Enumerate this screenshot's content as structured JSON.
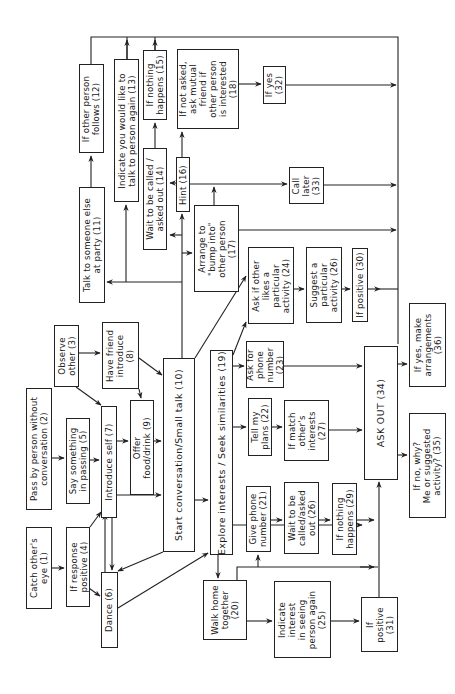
{
  "diagram": {
    "type": "flowchart",
    "orientation": "rotated-90-ccw",
    "nodes": [
      {
        "id": 1,
        "label": "Catch other's\neye (1)",
        "x": 26,
        "y": 527,
        "w": 26,
        "h": 82
      },
      {
        "id": 2,
        "label": "Pass by person without\nconversation (2)",
        "x": 26,
        "y": 388,
        "w": 26,
        "h": 122
      },
      {
        "id": 3,
        "label": "Observe\nother (3)",
        "x": 54,
        "y": 325,
        "w": 25,
        "h": 62
      },
      {
        "id": 4,
        "label": "If response\npositive (4)",
        "x": 66,
        "y": 527,
        "w": 24,
        "h": 80
      },
      {
        "id": 5,
        "label": "Say something\nin passing (5)",
        "x": 66,
        "y": 418,
        "w": 24,
        "h": 86
      },
      {
        "id": 6,
        "label": "Dance (6)",
        "x": 101,
        "y": 572,
        "w": 17,
        "h": 76
      },
      {
        "id": 7,
        "label": "Introduce self (7)",
        "x": 101,
        "y": 406,
        "w": 16,
        "h": 112
      },
      {
        "id": 8,
        "label": "Have friend\nintroduce\n(8)",
        "x": 102,
        "y": 322,
        "w": 37,
        "h": 67
      },
      {
        "id": 9,
        "label": "Offer\nfood/drink (9)",
        "x": 130,
        "y": 400,
        "w": 24,
        "h": 95
      },
      {
        "id": 10,
        "label": "Start conversation/Small talk (10)",
        "x": 163,
        "y": 358,
        "w": 32,
        "h": 194
      },
      {
        "id": 11,
        "label": "Talk to someone else\nat party (11)",
        "x": 79,
        "y": 187,
        "w": 26,
        "h": 116
      },
      {
        "id": 12,
        "label": "If other person\nfollows (12)",
        "x": 79,
        "y": 64,
        "w": 25,
        "h": 89
      },
      {
        "id": 13,
        "label": "Indicate you would like to\ntalk to person again (13)",
        "x": 114,
        "y": 59,
        "w": 25,
        "h": 143
      },
      {
        "id": 14,
        "label": "Wait to be called /\nasked out (14)",
        "x": 143,
        "y": 148,
        "w": 24,
        "h": 102
      },
      {
        "id": 15,
        "label": "If nothing\nhappens (15)",
        "x": 143,
        "y": 50,
        "w": 24,
        "h": 70
      },
      {
        "id": 16,
        "label": "Hint (16)",
        "x": 176,
        "y": 157,
        "w": 14,
        "h": 55
      },
      {
        "id": 17,
        "label": "Arrange to\n\"bump into\"\nother person\n(17)",
        "x": 194,
        "y": 205,
        "w": 45,
        "h": 87
      },
      {
        "id": 18,
        "label": "If not asked,\nask mutual\nfriend if\nother person\nis interested\n(18)",
        "x": 177,
        "y": 49,
        "w": 62,
        "h": 80
      },
      {
        "id": 19,
        "label": "Explore interests / Seek similarities (19)",
        "x": 210,
        "y": 350,
        "w": 23,
        "h": 205
      },
      {
        "id": 20,
        "label": "Walk home\ntogether\n(20)",
        "x": 203,
        "y": 580,
        "w": 44,
        "h": 60
      },
      {
        "id": 21,
        "label": "Give phone\nnumber (21)",
        "x": 246,
        "y": 486,
        "w": 25,
        "h": 66
      },
      {
        "id": 22,
        "label": "Tell my\nplans (22)",
        "x": 248,
        "y": 398,
        "w": 24,
        "h": 58
      },
      {
        "id": 23,
        "label": "Ask for\nphone\nnumber\n(23)",
        "x": 246,
        "y": 341,
        "w": 38,
        "h": 47
      },
      {
        "id": 24,
        "label": "Ask if other\nlikes a\nparticular\nactivity (24)",
        "x": 248,
        "y": 247,
        "w": 46,
        "h": 77
      },
      {
        "id": 25,
        "label": "Indicate\ninterest\nin seeing\nperson again\n(25)",
        "x": 274,
        "y": 581,
        "w": 57,
        "h": 77
      },
      {
        "id": 26,
        "label": "Suggest a\nparticular\nactivity (26)",
        "x": 306,
        "y": 247,
        "w": 36,
        "h": 76
      },
      {
        "id": "26b",
        "label": "Wait to be\ncalled/asked\nout (26)",
        "x": 284,
        "y": 482,
        "w": 35,
        "h": 72
      },
      {
        "id": 27,
        "label": "If match\nother's\ninterests\n(27)",
        "x": 284,
        "y": 400,
        "w": 45,
        "h": 61
      },
      {
        "id": 29,
        "label": "If nothing\nhappens (29)",
        "x": 332,
        "y": 483,
        "w": 25,
        "h": 72
      },
      {
        "id": 30,
        "label": "If positive (30)",
        "x": 352,
        "y": 248,
        "w": 16,
        "h": 74
      },
      {
        "id": 31,
        "label": "If\npositive\n(31)",
        "x": 361,
        "y": 597,
        "w": 37,
        "h": 55
      },
      {
        "id": 34,
        "label": "ASK OUT (34)",
        "x": 364,
        "y": 346,
        "w": 34,
        "h": 134
      },
      {
        "id": 32,
        "label": "If yes\n(32)",
        "x": 263,
        "y": 66,
        "w": 23,
        "h": 38
      },
      {
        "id": 33,
        "label": "Call\nlater\n(33)",
        "x": 289,
        "y": 167,
        "w": 35,
        "h": 37
      },
      {
        "id": 35,
        "label": "If no, why?\nMe or suggested\nactivity? (35)",
        "x": 409,
        "y": 413,
        "w": 37,
        "h": 105
      },
      {
        "id": 36,
        "label": "If yes, make\narrangements\n(36)",
        "x": 409,
        "y": 303,
        "w": 37,
        "h": 84
      }
    ],
    "edges": [
      [
        "1",
        "4"
      ],
      [
        "4",
        "7"
      ],
      [
        "4",
        "6"
      ],
      [
        "2",
        "5"
      ],
      [
        "5",
        "7"
      ],
      [
        "3",
        "7"
      ],
      [
        "3",
        "8"
      ],
      [
        "8",
        "9"
      ],
      [
        "8",
        "10"
      ],
      [
        "7",
        "9"
      ],
      [
        "9",
        "10"
      ],
      [
        "7",
        "10"
      ],
      [
        "7",
        "6"
      ],
      [
        "6",
        "7"
      ],
      [
        "10",
        "6"
      ],
      [
        "6",
        "19"
      ],
      [
        "10",
        "19"
      ],
      [
        "10",
        "11"
      ],
      [
        "10",
        "17"
      ],
      [
        "10",
        "14"
      ],
      [
        "10",
        "16"
      ],
      [
        "10",
        "13"
      ],
      [
        "11",
        "12"
      ],
      [
        "14",
        "15"
      ],
      [
        "16",
        "18"
      ],
      [
        "16",
        "33"
      ],
      [
        "18",
        "32"
      ],
      [
        "17",
        "34"
      ],
      [
        "19",
        "20"
      ],
      [
        "19",
        "22"
      ],
      [
        "19",
        "23"
      ],
      [
        "19",
        "24"
      ],
      [
        "10",
        "24"
      ],
      [
        "19",
        "34"
      ],
      [
        "20",
        "21"
      ],
      [
        "20",
        "25"
      ],
      [
        "20",
        "34"
      ],
      [
        "21",
        "26b"
      ],
      [
        "26b",
        "29"
      ],
      [
        "29",
        "34"
      ],
      [
        "22",
        "27"
      ],
      [
        "27",
        "34"
      ],
      [
        "23",
        "34"
      ],
      [
        "24",
        "26"
      ],
      [
        "26",
        "30"
      ],
      [
        "30",
        "34"
      ],
      [
        "25",
        "31"
      ],
      [
        "31",
        "34"
      ],
      [
        "34",
        "35"
      ],
      [
        "34",
        "36"
      ],
      [
        "12",
        "34"
      ],
      [
        "13",
        "34"
      ],
      [
        "15",
        "34"
      ],
      [
        "32",
        "34"
      ],
      [
        "33",
        "34"
      ]
    ]
  }
}
